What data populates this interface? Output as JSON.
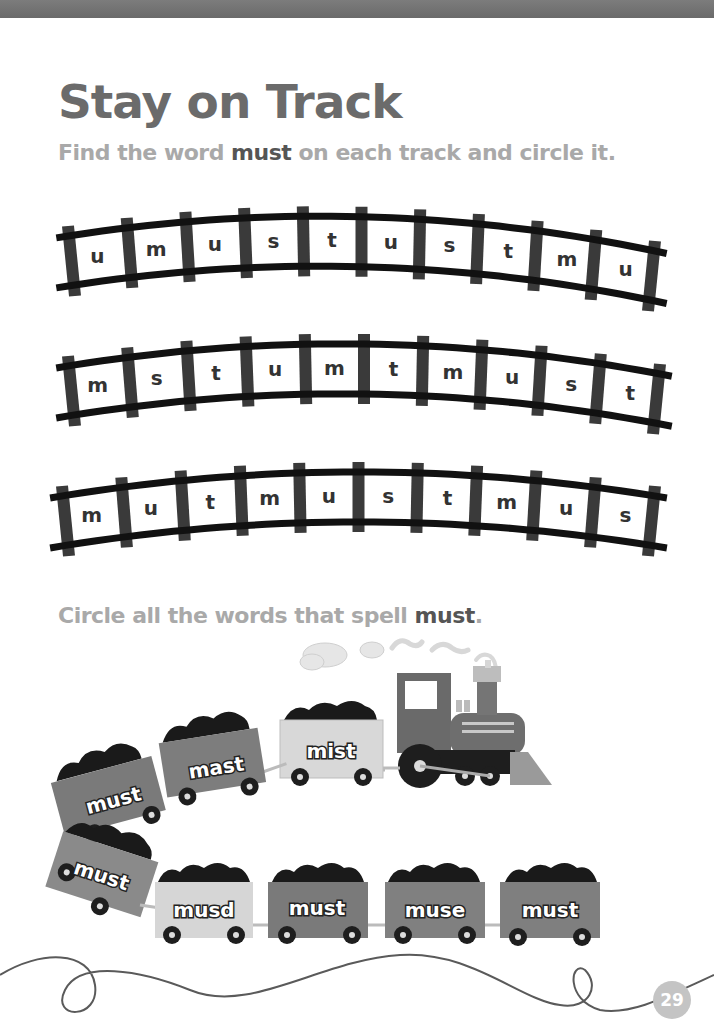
{
  "page": {
    "title": "Stay on Track",
    "page_number": "29"
  },
  "section1": {
    "instruction_before": "Find the word ",
    "instruction_keyword": "must",
    "instruction_after": " on each track and circle it.",
    "tracks": [
      {
        "letters": [
          "u",
          "m",
          "u",
          "s",
          "t",
          "u",
          "s",
          "t",
          "m",
          "u"
        ]
      },
      {
        "letters": [
          "m",
          "s",
          "t",
          "u",
          "m",
          "t",
          "m",
          "u",
          "s",
          "t"
        ]
      },
      {
        "letters": [
          "m",
          "u",
          "t",
          "m",
          "u",
          "s",
          "t",
          "m",
          "u",
          "s"
        ]
      }
    ]
  },
  "section2": {
    "instruction_before": "Circle all the words that spell ",
    "instruction_keyword": "must",
    "instruction_after": ".",
    "top_row_cars": [
      {
        "word": "must"
      },
      {
        "word": "mast"
      },
      {
        "word": "mist"
      }
    ],
    "corner_car": {
      "word": "must"
    },
    "bottom_row_cars": [
      {
        "word": "musd"
      },
      {
        "word": "must"
      },
      {
        "word": "muse"
      },
      {
        "word": "must"
      }
    ]
  },
  "colors": {
    "title": "#6b6b6b",
    "instruction": "#a9a9a9",
    "keyword": "#555555",
    "rail": "#111111",
    "tie": "#3a3a3a"
  }
}
